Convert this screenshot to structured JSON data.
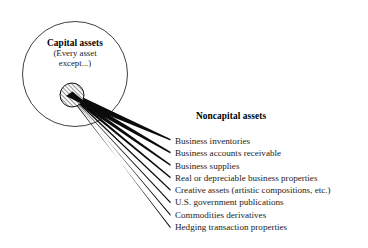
{
  "diagram": {
    "type": "venn-fan-diagram",
    "colors": {
      "stroke": "#000000",
      "text": "#1b1b1b",
      "heading": "#000000",
      "background": "#ffffff",
      "hatch": "#000000"
    },
    "capital_group": {
      "title": "Capital assets",
      "subtitle_line_1": "(Every asset",
      "subtitle_line_2": "except...)",
      "circle": {
        "name": "capital-assets-circle",
        "cx": 75,
        "cy": 74,
        "r": 52.5
      },
      "exception_marker": {
        "name": "hatched-exception-circle",
        "cx": 72,
        "cy": 95,
        "r": 12,
        "fill_pattern": "diagonal-hatch"
      }
    },
    "noncapital_group": {
      "heading": "Noncapital assets",
      "items": [
        "Business inventories",
        "Business accounts receivable",
        "Business supplies",
        "Real or depreciable business properties",
        "Creative assets (artistic compositions, etc.)",
        "U.S. government publications",
        "Commodities derivatives",
        "Hedging transaction properties"
      ]
    },
    "connectors": {
      "name": "fan-connector-lines",
      "count": 8,
      "origin": {
        "x": 77,
        "y": 99
      },
      "endpoints": [
        {
          "x": 170,
          "y": 140
        },
        {
          "x": 170,
          "y": 153
        },
        {
          "x": 170,
          "y": 165
        },
        {
          "x": 170,
          "y": 178
        },
        {
          "x": 170,
          "y": 190
        },
        {
          "x": 170,
          "y": 203
        },
        {
          "x": 170,
          "y": 215
        },
        {
          "x": 170,
          "y": 228
        }
      ]
    }
  }
}
